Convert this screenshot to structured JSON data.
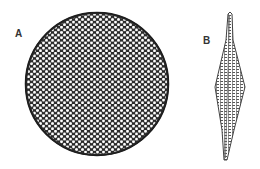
{
  "figure": {
    "panels": [
      {
        "label": "A",
        "shape": "centric-diatom-valve",
        "description": "circular valve with hexagonal areolae"
      },
      {
        "label": "B",
        "shape": "pennate-diatom-valve",
        "description": "elongate rhomboid valve with transverse striae"
      }
    ],
    "colors": {
      "ink": "#2a2a2a",
      "pore": "#ffffff",
      "background": "#ffffff"
    }
  }
}
